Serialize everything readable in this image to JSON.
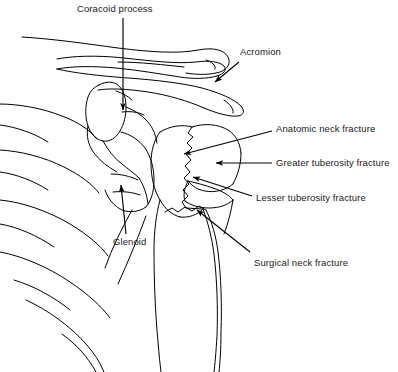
{
  "figure": {
    "background_color": "#ffffff",
    "line_color": "#000000",
    "text_color": "#1a1a1a",
    "width": 398,
    "height": 372
  },
  "labels": [
    {
      "id": "coracoid-process",
      "text": "Coracoid process",
      "x": 77,
      "y": 4,
      "anchor": "left",
      "leader": {
        "type": "arrow",
        "from": [
          123,
          18
        ],
        "to": [
          123,
          110
        ],
        "direction": "down"
      }
    },
    {
      "id": "acromion",
      "text": "Acromion",
      "x": 240,
      "y": 47,
      "anchor": "left",
      "leader": {
        "type": "arrow",
        "from": [
          239,
          62
        ],
        "to": [
          214,
          83
        ],
        "direction": "down-left"
      }
    },
    {
      "id": "anatomic-neck-fracture",
      "text": "Anatomic neck fracture",
      "x": 276,
      "y": 124,
      "anchor": "left",
      "leader": {
        "type": "arrow",
        "from": [
          272,
          131
        ],
        "to": [
          183,
          154
        ],
        "direction": "down-left"
      }
    },
    {
      "id": "greater-tuberosity-fracture",
      "text": "Greater tuberosity fracture",
      "x": 276,
      "y": 158,
      "anchor": "left",
      "leader": {
        "type": "arrow",
        "from": [
          272,
          163
        ],
        "to": [
          215,
          163
        ],
        "direction": "left"
      }
    },
    {
      "id": "lesser-tuberosity-fracture",
      "text": "Lesser tuberosity fracture",
      "x": 256,
      "y": 193,
      "anchor": "left",
      "leader": {
        "type": "arrow",
        "from": [
          252,
          196
        ],
        "to": [
          192,
          177
        ],
        "direction": "up-left"
      }
    },
    {
      "id": "glenoid",
      "text": "Glenoid",
      "x": 113,
      "y": 237,
      "anchor": "left",
      "leader": {
        "type": "arrow",
        "from": [
          126,
          234
        ],
        "to": [
          121,
          184
        ],
        "direction": "up"
      }
    },
    {
      "id": "surgical-neck-fracture",
      "text": "Surgical neck fracture",
      "x": 254,
      "y": 258,
      "anchor": "left",
      "leader": {
        "type": "arrow",
        "from": [
          250,
          252
        ],
        "to": [
          196,
          209
        ],
        "direction": "up-left"
      }
    }
  ],
  "anatomy": [
    {
      "id": "clavicle",
      "name": "Clavicle"
    },
    {
      "id": "acromion",
      "name": "Acromion"
    },
    {
      "id": "coracoid-process",
      "name": "Coracoid process"
    },
    {
      "id": "scapula-body",
      "name": "Scapula body"
    },
    {
      "id": "glenoid",
      "name": "Glenoid fossa"
    },
    {
      "id": "ribs",
      "name": "Ribs"
    },
    {
      "id": "humeral-head",
      "name": "Humeral head fragment"
    },
    {
      "id": "greater-tuberosity",
      "name": "Greater tuberosity fragment"
    },
    {
      "id": "lesser-tuberosity",
      "name": "Lesser tuberosity fragment"
    },
    {
      "id": "humeral-shaft",
      "name": "Humeral shaft"
    }
  ]
}
